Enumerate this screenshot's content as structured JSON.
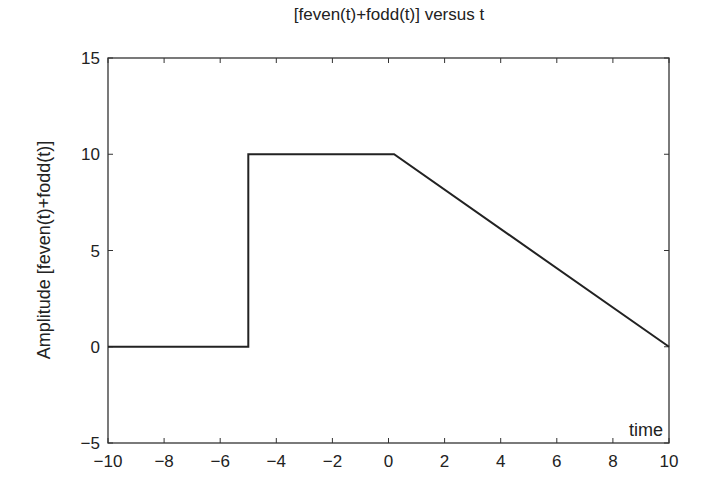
{
  "chart_data": {
    "type": "line",
    "title": "[feven(t)+fodd(t)] versus t",
    "xlabel": "time",
    "ylabel": "Amplitude [feven(t)+fodd(t)]",
    "xlim": [
      -10,
      10
    ],
    "ylim": [
      -5,
      15
    ],
    "xticks": [
      -10,
      -8,
      -6,
      -4,
      -2,
      0,
      2,
      4,
      6,
      8,
      10
    ],
    "xtick_labels": [
      "−10",
      "−8",
      "−6",
      "−4",
      "−2",
      "0",
      "2",
      "4",
      "6",
      "8",
      "10"
    ],
    "yticks": [
      -5,
      0,
      5,
      10,
      15
    ],
    "ytick_labels": [
      "−5",
      "0",
      "5",
      "10",
      "15"
    ],
    "grid": false,
    "legend": null,
    "series": [
      {
        "name": "feven(t)+fodd(t)",
        "color": "#222222",
        "x": [
          -10,
          -5,
          -5,
          0.2,
          10
        ],
        "y": [
          0,
          0,
          10,
          10,
          0
        ]
      }
    ]
  }
}
